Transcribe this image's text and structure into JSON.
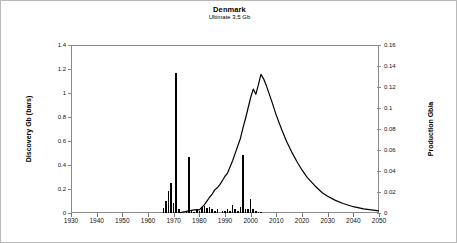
{
  "chart": {
    "title": "Denmark",
    "subtitle": "Ultimate  3,5 Gb",
    "ylabel_left": "Discovery Gb (bars)",
    "ylabel_right": "Production Gb/a"
  },
  "chart_data": {
    "type": "bar",
    "title": "Denmark",
    "subtitle": "Ultimate  3,5 Gb",
    "xlabel": "",
    "ylabel": "Discovery Gb (bars)",
    "ylabel_secondary": "Production Gb/a",
    "xlim": [
      1930,
      2050
    ],
    "ylim": [
      0,
      1.4
    ],
    "ylim_secondary": [
      0,
      0.16
    ],
    "grid": false,
    "legend": null,
    "xticks": [
      1930,
      1940,
      1950,
      1960,
      1970,
      1980,
      1990,
      2000,
      2010,
      2020,
      2030,
      2040,
      2050
    ],
    "yticks_left": [
      0,
      0.2,
      0.4,
      0.6,
      0.8,
      1,
      1.2,
      1.4
    ],
    "ytick_labels_left": [
      "0",
      "0.2",
      "0.4",
      "0.6",
      "0.8",
      "1",
      "1.2",
      "1.4"
    ],
    "yticks_right": [
      0,
      0.02,
      0.04,
      0.06,
      0.08,
      0.1,
      0.12,
      0.14,
      0.16
    ],
    "ytick_labels_right": [
      "0",
      "0.02",
      "0.04",
      "0.06",
      "0.08",
      "0.1",
      "0.12",
      "0.14",
      "0.16"
    ],
    "series": [
      {
        "name": "Discovery Gb (bars)",
        "type": "bar",
        "axis": "left",
        "color": "#000000",
        "x": [
          1966,
          1967,
          1968,
          1969,
          1970,
          1971,
          1972,
          1975,
          1976,
          1977,
          1978,
          1979,
          1980,
          1981,
          1982,
          1983,
          1984,
          1985,
          1986,
          1987,
          1989,
          1990,
          1991,
          1992,
          1993,
          1994,
          1995,
          1996,
          1997,
          1998,
          1999,
          2000,
          2001,
          2002,
          2003,
          2004
        ],
        "values": [
          0.04,
          0.1,
          0.18,
          0.25,
          0.08,
          1.17,
          0.03,
          0.02,
          0.47,
          0.02,
          0.01,
          0.03,
          0.02,
          0.05,
          0.06,
          0.04,
          0.05,
          0.03,
          0.02,
          0.03,
          0.02,
          0.02,
          0.03,
          0.02,
          0.07,
          0.03,
          0.02,
          0.05,
          0.48,
          0.03,
          0.03,
          0.12,
          0.03,
          0.02,
          0.01,
          0.01
        ]
      },
      {
        "name": "Production Gb/a",
        "type": "line",
        "axis": "right",
        "color": "#000000",
        "x": [
          1972,
          1974,
          1976,
          1978,
          1980,
          1982,
          1984,
          1985,
          1986,
          1987,
          1988,
          1989,
          1990,
          1991,
          1992,
          1993,
          1994,
          1995,
          1996,
          1997,
          1998,
          1999,
          2000,
          2001,
          2002,
          2003,
          2004,
          2005,
          2006,
          2008,
          2010,
          2012,
          2014,
          2016,
          2018,
          2020,
          2022,
          2025,
          2028,
          2030,
          2033,
          2036,
          2040,
          2044,
          2047,
          2050
        ],
        "values": [
          0.0,
          0.001,
          0.002,
          0.003,
          0.003,
          0.008,
          0.015,
          0.018,
          0.022,
          0.024,
          0.027,
          0.031,
          0.035,
          0.038,
          0.044,
          0.05,
          0.057,
          0.064,
          0.071,
          0.081,
          0.09,
          0.1,
          0.11,
          0.118,
          0.113,
          0.122,
          0.132,
          0.128,
          0.122,
          0.108,
          0.093,
          0.08,
          0.068,
          0.058,
          0.049,
          0.041,
          0.034,
          0.026,
          0.019,
          0.016,
          0.012,
          0.009,
          0.006,
          0.004,
          0.003,
          0.002
        ]
      }
    ]
  }
}
